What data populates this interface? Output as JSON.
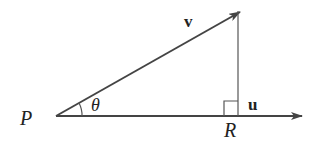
{
  "diagram": {
    "labels": {
      "point_p": "P",
      "point_r": "R",
      "vector_v": "v",
      "vector_u": "u",
      "angle": "θ"
    },
    "colors": {
      "stroke": "#444444",
      "text": "#222222",
      "background": "#ffffff"
    }
  }
}
